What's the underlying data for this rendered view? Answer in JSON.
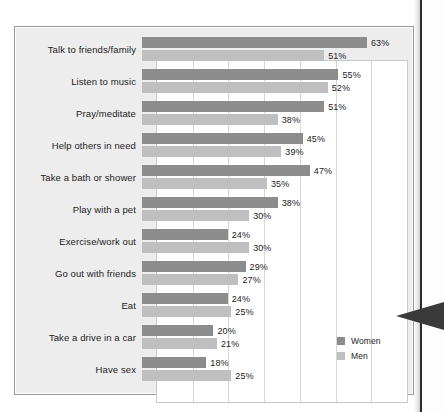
{
  "chart_data": {
    "type": "bar",
    "orientation": "horizontal",
    "title": "",
    "subtitle": "",
    "xlabel": "",
    "ylabel": "",
    "xlim": [
      0,
      70
    ],
    "grid": true,
    "gridline_step": 10,
    "legend_position": "inside-right",
    "value_suffix": "%",
    "categories": [
      "Talk to friends/family",
      "Listen to music",
      "Pray/meditate",
      "Help others in need",
      "Take a bath or shower",
      "Play with a pet",
      "Exercise/work out",
      "Go out with friends",
      "Eat",
      "Take a drive in a car",
      "Have sex"
    ],
    "series": [
      {
        "name": "Women",
        "color": "#8c8c8c",
        "values": [
          63,
          55,
          51,
          45,
          47,
          38,
          24,
          29,
          24,
          20,
          18
        ],
        "labels": [
          "63%",
          "55%",
          "51%",
          "45%",
          "47%",
          "38%",
          "24%",
          "29%",
          "24%",
          "20%",
          "18%"
        ]
      },
      {
        "name": "Men",
        "color": "#bfbfbf",
        "values": [
          51,
          52,
          38,
          39,
          35,
          30,
          30,
          27,
          25,
          21,
          25
        ],
        "labels": [
          "51%",
          "52%",
          "38%",
          "39%",
          "35%",
          "30%",
          "30%",
          "27%",
          "25%",
          "21%",
          "25%"
        ]
      }
    ]
  },
  "legend": {
    "items": [
      {
        "label": "Women",
        "color": "#8c8c8c"
      },
      {
        "label": "Men",
        "color": "#bfbfbf"
      }
    ]
  },
  "colors": {
    "women": "#8c8c8c",
    "men": "#bfbfbf",
    "panel_background": "#ededed",
    "plot_background": "#ffffff",
    "gridline": "#d6d6d6",
    "text": "#1c1c1c",
    "pointer": "#3a3a3a"
  }
}
